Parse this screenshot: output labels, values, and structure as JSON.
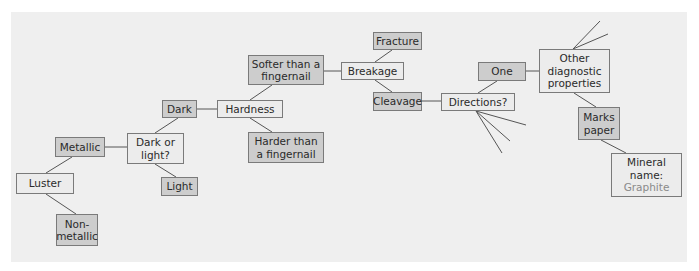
{
  "diagram": {
    "title": "",
    "colors": {
      "panel_background": "#efefef",
      "question_box": "#ececec",
      "answer_box": "#cdcdcd",
      "border": "#7a7a7a",
      "result_text": "#8a8a8a"
    },
    "nodes": {
      "luster": "Luster",
      "metallic": "Metallic",
      "nonmetallic": "Non-\nmetallic",
      "dark_or_light": "Dark or\nlight?",
      "dark": "Dark",
      "light": "Light",
      "hardness": "Hardness",
      "softer": "Softer than a\nfingernail",
      "harder": "Harder than\na fingernail",
      "breakage": "Breakage",
      "fracture": "Fracture",
      "cleavage": "Cleavage",
      "directions": "Directions?",
      "one": "One",
      "other_props": "Other\ndiagnostic\nproperties",
      "marks_paper": "Marks\npaper",
      "mineral_name_label": "Mineral\nname:",
      "mineral_name_value": "Graphite"
    },
    "edges": [
      [
        "luster",
        "metallic"
      ],
      [
        "luster",
        "nonmetallic"
      ],
      [
        "metallic",
        "dark_or_light"
      ],
      [
        "dark_or_light",
        "dark"
      ],
      [
        "dark_or_light",
        "light"
      ],
      [
        "dark",
        "hardness"
      ],
      [
        "hardness",
        "softer"
      ],
      [
        "hardness",
        "harder"
      ],
      [
        "softer",
        "breakage"
      ],
      [
        "breakage",
        "fracture"
      ],
      [
        "breakage",
        "cleavage"
      ],
      [
        "cleavage",
        "directions"
      ],
      [
        "directions",
        "one"
      ],
      [
        "one",
        "other_props"
      ],
      [
        "other_props",
        "marks_paper"
      ],
      [
        "marks_paper",
        "mineral_name"
      ]
    ]
  }
}
